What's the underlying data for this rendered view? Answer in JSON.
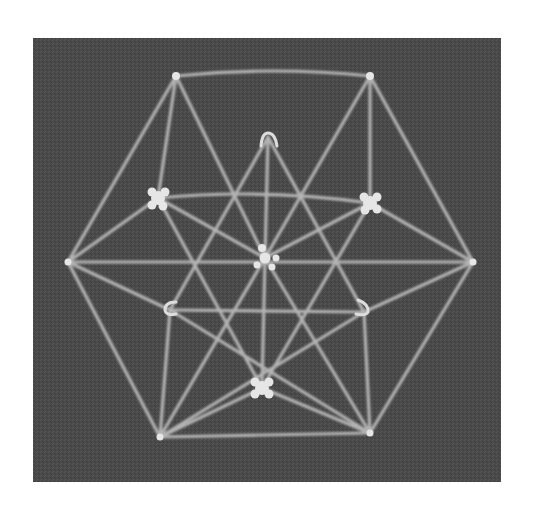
{
  "image": {
    "subject": "Vector equilibrium (cuboctahedron) stick-and-connector model photographed against a dark background",
    "caption": "",
    "colors": {
      "page_background": "#ffffff",
      "photo_background": "#4a4a4a",
      "stick": "#b8b8b8",
      "connector": "#e6e6e6"
    },
    "frame": {
      "x": 33,
      "y": 38,
      "width": 468,
      "height": 444
    },
    "nodes": [
      {
        "id": "top-left",
        "x": 176,
        "y": 76,
        "type": "small"
      },
      {
        "id": "top-right",
        "x": 370,
        "y": 76,
        "type": "small"
      },
      {
        "id": "back-top",
        "x": 268,
        "y": 137,
        "type": "arch"
      },
      {
        "id": "front-left",
        "x": 158,
        "y": 198,
        "type": "large"
      },
      {
        "id": "front-right",
        "x": 370,
        "y": 203,
        "type": "large"
      },
      {
        "id": "center",
        "x": 265,
        "y": 258,
        "type": "large"
      },
      {
        "id": "left",
        "x": 68,
        "y": 262,
        "type": "small"
      },
      {
        "id": "right",
        "x": 473,
        "y": 262,
        "type": "small"
      },
      {
        "id": "back-lower-left",
        "x": 170,
        "y": 310,
        "type": "arch"
      },
      {
        "id": "back-lower-right",
        "x": 364,
        "y": 312,
        "type": "arch"
      },
      {
        "id": "bottom-front",
        "x": 262,
        "y": 388,
        "type": "large"
      },
      {
        "id": "bottom-left",
        "x": 160,
        "y": 437,
        "type": "small"
      },
      {
        "id": "bottom-right",
        "x": 370,
        "y": 433,
        "type": "small"
      }
    ]
  }
}
